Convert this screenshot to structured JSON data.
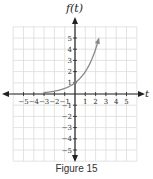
{
  "chart_data": {
    "type": "line",
    "title": "",
    "caption": "Figure 15",
    "xlabel": "t",
    "ylabel": "f(t)",
    "xlim": [
      -6,
      6
    ],
    "ylim": [
      -6,
      6
    ],
    "grid": true,
    "x_ticks": [
      -5,
      -4,
      -3,
      -2,
      -1,
      1,
      2,
      3,
      4,
      5
    ],
    "y_ticks": [
      -5,
      -4,
      -3,
      -2,
      -1,
      1,
      2,
      3,
      4,
      5
    ],
    "series": [
      {
        "name": "f(t)",
        "function": "2^t",
        "x": [
          -3,
          -2,
          -1,
          0,
          1,
          2,
          2.3
        ],
        "y": [
          0.125,
          0.25,
          0.5,
          1,
          2,
          4,
          4.9
        ],
        "end_arrow": true,
        "color": "#888888"
      }
    ]
  },
  "labels": {
    "caption": "Figure 15",
    "ylabel": "f(t)",
    "xlabel": "t"
  }
}
